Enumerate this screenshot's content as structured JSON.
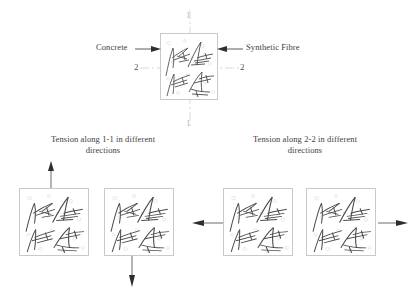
{
  "figure": {
    "title_present": false,
    "background_color": "#ffffff",
    "ink_color": "#4a4a4a",
    "box_border_color": "#c9c9c9"
  },
  "main_specimen": {
    "name": "central-specimen",
    "callouts": [
      {
        "id": "concrete",
        "label": "Concrete",
        "side": "left"
      },
      {
        "id": "synthetic-fibre",
        "label": "Synthetic Fibre",
        "side": "right"
      }
    ],
    "section_lines": [
      {
        "id": "section-1-1",
        "label_top": "1",
        "label_bottom": "1",
        "orientation": "vertical"
      },
      {
        "id": "section-2-2",
        "label_left": "2",
        "label_right": "2",
        "orientation": "horizontal"
      }
    ]
  },
  "groups": [
    {
      "id": "group-1-1",
      "caption_line1": "Tension along 1-1 in different",
      "caption_line2": "directions",
      "arrows": [
        {
          "id": "arrow-up",
          "direction": "up"
        },
        {
          "id": "arrow-down",
          "direction": "down"
        }
      ],
      "specimens": [
        {
          "id": "specimen-1-1-a"
        },
        {
          "id": "specimen-1-1-b"
        }
      ]
    },
    {
      "id": "group-2-2",
      "caption_line1": "Tension along 2-2 in different",
      "caption_line2": "directions",
      "arrows": [
        {
          "id": "arrow-left",
          "direction": "left"
        },
        {
          "id": "arrow-right",
          "direction": "right"
        }
      ],
      "specimens": [
        {
          "id": "specimen-2-2-a"
        },
        {
          "id": "specimen-2-2-b"
        }
      ]
    }
  ]
}
